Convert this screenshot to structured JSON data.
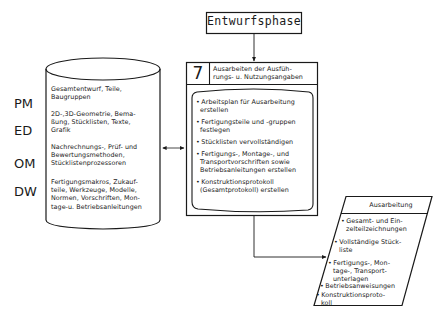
{
  "top": {
    "title": "Entwurfsphase"
  },
  "database": {
    "layers": [
      {
        "code": "PM",
        "text": [
          "Gesamtentwurf, Teile,",
          "Baugruppen"
        ]
      },
      {
        "code": "ED",
        "text": [
          "2D-,3D-Geometrie, Bema-",
          "ßung, Stücklisten, Texte,",
          "Grafik"
        ]
      },
      {
        "code": "OM",
        "text": [
          "Nachrechnungs-, Prüf- und",
          "Bewertungsmethoden,",
          "Stücklistenprozessoren"
        ]
      },
      {
        "code": "DW",
        "text": [
          "Fertigungsmakros, Zukauf-",
          "teile, Werkzeuge, Modelle,",
          "Normen, Vorschriften, Mon-",
          "tage-u. Betriebsanleitungen"
        ]
      }
    ]
  },
  "step": {
    "number": "7",
    "title": [
      "Ausarbeiten der Ausfüh-",
      "rungs- u. Nutzungsangaben"
    ],
    "tasks": [
      [
        "Arbeitsplan für Ausarbeitung",
        "erstellen"
      ],
      [
        "Fertigungsteile und -gruppen",
        "festlegen"
      ],
      [
        "Stücklisten vervollständigen"
      ],
      [
        "Fertigungs-, Montage-, und",
        "Transportvorschriften sowie",
        "Betriebsanleitungen erstellen"
      ],
      [
        "Konstruktionsprotokoll",
        "(Gesamtprotokoll) erstellen"
      ]
    ]
  },
  "output": {
    "title": "Ausarbeitung",
    "items": [
      [
        "Gesamt- und Ein-",
        "zelteilzeichnungen"
      ],
      [
        "Vollständige Stück-",
        "liste"
      ],
      [
        "Fertigungs-, Mon-",
        "tage-, Transport-",
        "unterlagen"
      ],
      [
        "Betriebsanweisungen"
      ],
      [
        "Konstruktionsproto-",
        "koll"
      ]
    ]
  },
  "colors": {
    "line": "#1a1a1a",
    "background": "#ffffff"
  }
}
